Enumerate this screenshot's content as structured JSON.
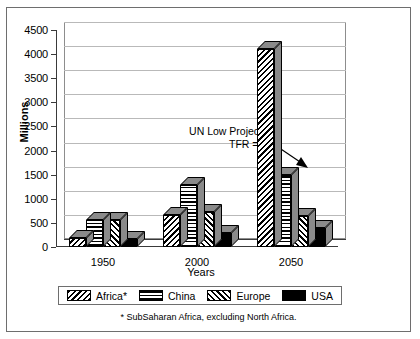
{
  "chart_data": {
    "type": "bar",
    "title": "",
    "xlabel": "Years",
    "ylabel": "Millions",
    "categories": [
      "1950",
      "2000",
      "2050"
    ],
    "ylim": [
      0,
      4500
    ],
    "yticks": [
      0,
      500,
      1000,
      1500,
      2000,
      2500,
      3000,
      3500,
      4000,
      4500
    ],
    "grid": true,
    "legend_position": "bottom",
    "series": [
      {
        "name": "Africa*",
        "pattern": "diagonal-backslash",
        "values": [
          180,
          670,
          4100
        ]
      },
      {
        "name": "China",
        "pattern": "horizontal-lines",
        "values": [
          550,
          1280,
          1500
        ]
      },
      {
        "name": "Europe",
        "pattern": "diagonal-forward",
        "values": [
          550,
          730,
          650
        ]
      },
      {
        "name": "USA",
        "pattern": "solid-black",
        "values": [
          160,
          280,
          400
        ]
      }
    ],
    "annotations": [
      {
        "text_line1": "UN Low Projection",
        "text_line2": "TFR = 1.6",
        "points_to": "Africa* 2050"
      }
    ],
    "footnote": "* SubSaharan Africa, excluding North  Africa."
  },
  "axis": {
    "y_title": "Millions",
    "x_title": "Years",
    "y_tick_labels": [
      "4500",
      "4000",
      "3500",
      "3000",
      "2500",
      "2000",
      "1500",
      "1000",
      "500",
      "0"
    ],
    "x_tick_labels": [
      "1950",
      "2000",
      "2050"
    ]
  },
  "annotation": {
    "line1": "UN Low Projection",
    "line2": "TFR = 1.6"
  },
  "legend": {
    "items": [
      {
        "label": "Africa*"
      },
      {
        "label": "China"
      },
      {
        "label": "Europe"
      },
      {
        "label": "USA"
      }
    ]
  },
  "footnote": {
    "text": "* SubSaharan Africa, excluding North  Africa."
  },
  "colors": {
    "ink": "#000000",
    "grid": "#b9b9b9",
    "axis": "#3a3a3a",
    "bar_side": "#8a8a8a",
    "frame": "#6e6e6e",
    "background": "#ffffff"
  }
}
